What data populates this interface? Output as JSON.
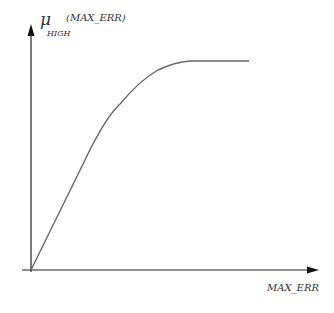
{
  "diagram": {
    "type": "membership-function",
    "y_axis_label": {
      "symbol": "μ",
      "subscript": "HIGH",
      "argument": "(MAX_ERR)"
    },
    "x_axis_label": "MAX_ERR",
    "curve": {
      "description": "Monotonically increasing, roughly linear from origin then saturating to a plateau",
      "shape": "linear-rise-then-saturate"
    },
    "colors": {
      "axis": "#222222",
      "curve": "#666666",
      "text": "#333333",
      "background": "#ffffff"
    }
  }
}
